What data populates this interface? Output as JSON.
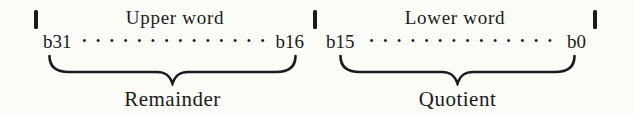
{
  "diagram": {
    "colors": {
      "ink": "#1a1a1a",
      "background": "#fbfbf8"
    },
    "sections": [
      {
        "word_label": "Upper word",
        "bit_high": "b31",
        "bit_low": "b16",
        "dots": "• • • • • • • • • • • • • •",
        "brace_label": "Remainder"
      },
      {
        "word_label": "Lower word",
        "bit_high": "b15",
        "bit_low": "b0",
        "dots": "• • • • • • • • • • • • • •",
        "brace_label": "Quotient"
      }
    ]
  }
}
